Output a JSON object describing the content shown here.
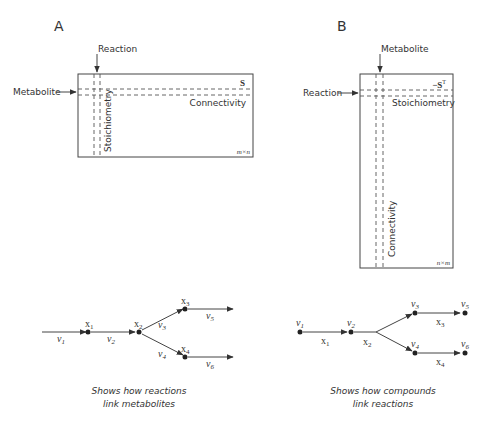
{
  "panelA": {
    "letter": "A",
    "top_label": "Reaction",
    "left_label": "Metabolite",
    "matrix_name": "S",
    "row_label": "Connectivity",
    "col_label": "Stoichiometry",
    "dims": "m×n",
    "graph": {
      "nodes": [
        "x1",
        "x2",
        "x3",
        "x4"
      ],
      "edges": [
        "v1",
        "v2",
        "v3",
        "v4",
        "v5",
        "v6"
      ],
      "labels": {
        "x1": "x",
        "x1_sub": "1",
        "x2": "x",
        "x2_sub": "2",
        "x3": "x",
        "x3_sub": "3",
        "x4": "x",
        "x4_sub": "4",
        "v1": "v",
        "v1_sub": "1",
        "v2": "v",
        "v2_sub": "2",
        "v3": "v",
        "v3_sub": "3",
        "v4": "v",
        "v4_sub": "4",
        "v5": "v",
        "v5_sub": "5",
        "v6": "v",
        "v6_sub": "6"
      }
    },
    "caption_line1": "Shows how reactions",
    "caption_line2": "link metabolites"
  },
  "panelB": {
    "letter": "B",
    "top_label": "Metabolite",
    "left_label": "Reaction",
    "matrix_name": "−S",
    "matrix_sup": "T",
    "row_label": "Stoichiometry",
    "col_label": "Connectivity",
    "dims": "n×m",
    "graph": {
      "nodes": [
        "v1",
        "v2",
        "v3",
        "v4",
        "v5",
        "v6"
      ],
      "edges": [
        "x1",
        "x2",
        "x3",
        "x4"
      ],
      "labels": {
        "v1": "v",
        "v1_sub": "1",
        "v2": "v",
        "v2_sub": "2",
        "v3": "v",
        "v3_sub": "3",
        "v4": "v",
        "v4_sub": "4",
        "v5": "v",
        "v5_sub": "5",
        "v6": "v",
        "v6_sub": "6",
        "x1": "x",
        "x1_sub": "1",
        "x2": "x",
        "x2_sub": "2",
        "x3": "x",
        "x3_sub": "3",
        "x4": "x",
        "x4_sub": "4"
      }
    },
    "caption_line1": "Shows how compounds",
    "caption_line2": "link reactions"
  }
}
